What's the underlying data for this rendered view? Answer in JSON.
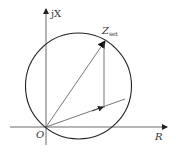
{
  "diagram": {
    "type": "impedance-circle",
    "axes": {
      "x_label": "R",
      "y_label": "jX",
      "origin_label": "O"
    },
    "point_label_main": "Z",
    "point_label_sub": "set",
    "colors": {
      "line": "#333333",
      "circle": "#222222",
      "background": "#ffffff"
    }
  }
}
